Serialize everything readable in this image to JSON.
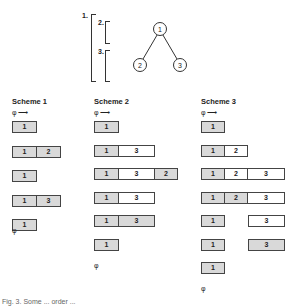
{
  "top_figure": {
    "brackets": [
      {
        "label": "1."
      },
      {
        "label": "2."
      },
      {
        "label": "3."
      }
    ],
    "tree": {
      "nodes": [
        {
          "id": "1",
          "label": "1"
        },
        {
          "id": "2",
          "label": "2"
        },
        {
          "id": "3",
          "label": "3"
        }
      ],
      "edges": [
        [
          "1",
          "2"
        ],
        [
          "1",
          "3"
        ]
      ]
    }
  },
  "schemes": [
    {
      "title": "Scheme 1",
      "start_label": "φ ⟶",
      "end_label": "φ",
      "rows": [
        [
          {
            "label": "1",
            "style": "shaded"
          }
        ],
        [
          {
            "label": "1",
            "style": "shaded"
          },
          {
            "label": "2",
            "style": "shaded"
          }
        ],
        [
          {
            "label": "1",
            "style": "shaded"
          }
        ],
        [
          {
            "label": "1",
            "style": "shaded"
          },
          {
            "label": "3",
            "style": "shaded"
          }
        ],
        [
          {
            "label": "1",
            "style": "shaded"
          }
        ]
      ]
    },
    {
      "title": "Scheme 2",
      "start_label": "φ ⟶",
      "end_label": "φ",
      "rows": [
        [
          {
            "label": "1",
            "style": "shaded"
          }
        ],
        [
          {
            "label": "1",
            "style": "shaded"
          },
          {
            "label": "3",
            "style": "white"
          }
        ],
        [
          {
            "label": "1",
            "style": "shaded"
          },
          {
            "label": "3",
            "style": "white"
          },
          {
            "label": "2",
            "style": "shaded"
          }
        ],
        [
          {
            "label": "1",
            "style": "shaded"
          },
          {
            "label": "3",
            "style": "white"
          }
        ],
        [
          {
            "label": "1",
            "style": "shaded"
          },
          {
            "label": "3",
            "style": "shaded"
          }
        ],
        [
          {
            "label": "1",
            "style": "shaded"
          }
        ]
      ]
    },
    {
      "title": "Scheme 3",
      "start_label": "φ ⟶",
      "end_label": "φ",
      "rows": [
        [
          {
            "label": "1",
            "style": "shaded"
          }
        ],
        [
          {
            "label": "1",
            "style": "shaded"
          },
          {
            "label": "2",
            "style": "white"
          }
        ],
        [
          {
            "label": "1",
            "style": "shaded"
          },
          {
            "label": "2",
            "style": "white"
          },
          {
            "label": "3",
            "style": "white"
          }
        ],
        [
          {
            "label": "1",
            "style": "shaded"
          },
          {
            "label": "2",
            "style": "shaded"
          },
          {
            "label": "3",
            "style": "white"
          }
        ],
        [
          {
            "label": "1",
            "style": "shaded"
          },
          {
            "label": "",
            "style": "gap"
          },
          {
            "label": "3",
            "style": "white"
          }
        ],
        [
          {
            "label": "1",
            "style": "shaded"
          },
          {
            "label": "",
            "style": "gap"
          },
          {
            "label": "3",
            "style": "shaded"
          }
        ],
        [
          {
            "label": "1",
            "style": "shaded"
          }
        ]
      ]
    }
  ],
  "caption": "Fig. 3.  Some ... order ..."
}
